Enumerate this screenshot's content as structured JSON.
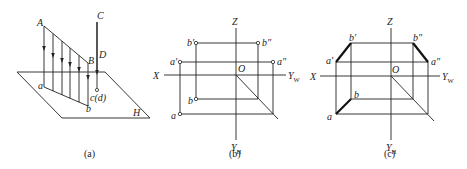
{
  "figure": {
    "panels": [
      {
        "id": "a",
        "caption": "(a)",
        "labels": {
          "A": "A",
          "B": "B",
          "C": "C",
          "D": "D",
          "a": "a",
          "b": "b",
          "cd": "c(d)",
          "H": "H"
        }
      },
      {
        "id": "b",
        "caption": "(b)",
        "labels": {
          "Z": "Z",
          "X": "X",
          "O": "O",
          "YW": "Y",
          "YW_sub": "W",
          "YH": "Y",
          "YH_sub": "H",
          "b_prime": "b′",
          "b_dprime": "b″",
          "a_prime": "a′",
          "a_dprime": "a″",
          "b": "b",
          "a": "a"
        }
      },
      {
        "id": "c",
        "caption": "(c)",
        "labels": {
          "Z": "Z",
          "X": "X",
          "O": "O",
          "YW": "Y",
          "YW_sub": "W",
          "YH": "Y",
          "YH_sub": "H",
          "b_prime": "b′",
          "b_dprime": "b″",
          "a_prime": "a′",
          "a_dprime": "a″",
          "b": "b",
          "a": "a"
        }
      }
    ]
  }
}
